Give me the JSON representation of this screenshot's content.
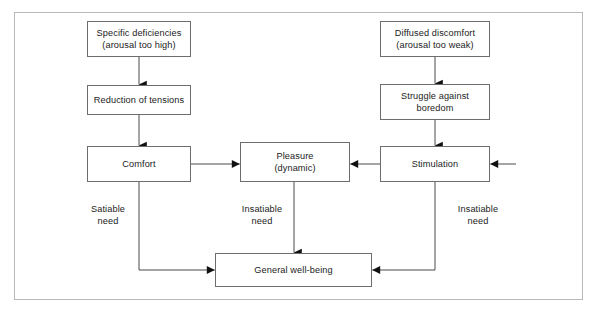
{
  "diagram": {
    "frame": {
      "border_color": "#b9b9b9"
    },
    "node_border_color": "#6d6d6d",
    "text_color": "#1b1b1b",
    "nodes": [
      {
        "id": "specific_deficiencies",
        "label": "Specific deficiencies\n(arousal too high)",
        "x": 87,
        "y": 21,
        "w": 104,
        "h": 36
      },
      {
        "id": "reduction_of_tensions",
        "label": "Reduction of tensions",
        "x": 87,
        "y": 85,
        "w": 104,
        "h": 30
      },
      {
        "id": "comfort",
        "label": "Comfort",
        "x": 87,
        "y": 146,
        "w": 104,
        "h": 36
      },
      {
        "id": "diffused_discomfort",
        "label": "Diffused discomfort\n(arousal too weak)",
        "x": 380,
        "y": 21,
        "w": 110,
        "h": 36
      },
      {
        "id": "struggle_against_boredom",
        "label": "Struggle against\nboredom",
        "x": 380,
        "y": 84,
        "w": 110,
        "h": 36
      },
      {
        "id": "stimulation",
        "label": "Stimulation",
        "x": 380,
        "y": 146,
        "w": 110,
        "h": 36
      },
      {
        "id": "pleasure",
        "label": "Pleasure\n(dynamic)",
        "x": 240,
        "y": 142,
        "w": 110,
        "h": 40
      },
      {
        "id": "general_well_being",
        "label": "General well-being",
        "x": 215,
        "y": 253,
        "w": 157,
        "h": 34
      }
    ],
    "edge_labels": [
      {
        "id": "satiable_need",
        "label": "Satiable\nneed",
        "x": 80,
        "y": 203,
        "w": 56
      },
      {
        "id": "insatiable_need_center",
        "label": "Insatiable\nneed",
        "x": 232,
        "y": 203,
        "w": 60
      },
      {
        "id": "insatiable_need_right",
        "label": "Insatiable\nneed",
        "x": 448,
        "y": 203,
        "w": 60
      }
    ],
    "edges": [
      {
        "id": "specific-to-reduction",
        "from": "specific_deficiencies",
        "to": "reduction_of_tensions",
        "kind": "arrow-down"
      },
      {
        "id": "reduction-to-comfort",
        "from": "reduction_of_tensions",
        "to": "comfort",
        "kind": "arrow-down"
      },
      {
        "id": "comfort-to-pleasure",
        "from": "comfort",
        "to": "pleasure",
        "kind": "arrow-right"
      },
      {
        "id": "diffused-to-struggle",
        "from": "diffused_discomfort",
        "to": "struggle_against_boredom",
        "kind": "arrow-down"
      },
      {
        "id": "struggle-to-stimulation",
        "from": "struggle_against_boredom",
        "to": "stimulation",
        "kind": "arrow-down"
      },
      {
        "id": "stimulation-to-pleasure",
        "from": "stimulation",
        "to": "pleasure",
        "kind": "arrow-left"
      },
      {
        "id": "external-to-stimulation",
        "from": "external",
        "to": "stimulation",
        "kind": "arrow-left-stub"
      },
      {
        "id": "comfort-to-wellbeing",
        "from": "comfort",
        "to": "general_well_being",
        "kind": "elbow-arrow-right",
        "label_ref": "satiable_need"
      },
      {
        "id": "pleasure-to-wellbeing",
        "from": "pleasure",
        "to": "general_well_being",
        "kind": "arrow-down",
        "label_ref": "insatiable_need_center"
      },
      {
        "id": "stimulation-to-wellbeing",
        "from": "stimulation",
        "to": "general_well_being",
        "kind": "elbow-arrow-left",
        "label_ref": "insatiable_need_right"
      }
    ]
  }
}
